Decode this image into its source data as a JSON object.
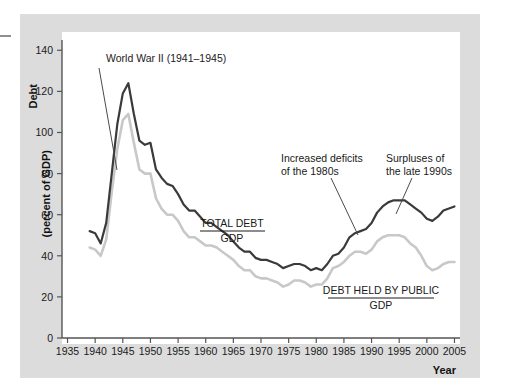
{
  "figure": {
    "background_color": "#ffffff",
    "panel_color": "#dcdcdc",
    "plot_color": "#ffffff"
  },
  "axes": {
    "y_title_line1": "Debt",
    "y_title_line2": "(percent of GDP)",
    "x_title": "Year",
    "y_ticks": [
      0,
      20,
      40,
      60,
      80,
      100,
      120,
      140
    ],
    "x_ticks": [
      1935,
      1940,
      1945,
      1950,
      1955,
      1960,
      1965,
      1970,
      1975,
      1980,
      1985,
      1990,
      1995,
      2000,
      2005
    ],
    "ylim": [
      0,
      145
    ],
    "xlim": [
      1934,
      2006
    ]
  },
  "annotations": {
    "wwii": "World War II (1941–1945)",
    "deficits_line1": "Increased deficits",
    "deficits_line2": "of the 1980s",
    "surpluses_line1": "Surpluses of",
    "surpluses_line2": "the late 1990s"
  },
  "series_labels": {
    "total_numerator": "TOTAL DEBT",
    "total_denominator": "GDP",
    "public_numerator": "DEBT HELD BY PUBLIC",
    "public_denominator": "GDP"
  },
  "colors": {
    "total_debt_line": "#3a3a3a",
    "public_debt_line": "#c8c8c8",
    "axis": "#555555",
    "leader_line": "#4a4a4a"
  },
  "chart_data": {
    "type": "line",
    "title": "",
    "xlabel": "Year",
    "ylabel": "Debt (percent of GDP)",
    "xlim": [
      1934,
      2006
    ],
    "ylim": [
      0,
      145
    ],
    "grid": false,
    "legend": "inline-labels",
    "x": [
      1939,
      1940,
      1941,
      1942,
      1943,
      1944,
      1945,
      1946,
      1947,
      1948,
      1949,
      1950,
      1951,
      1952,
      1953,
      1954,
      1955,
      1956,
      1957,
      1958,
      1959,
      1960,
      1961,
      1962,
      1963,
      1964,
      1965,
      1966,
      1967,
      1968,
      1969,
      1970,
      1971,
      1972,
      1973,
      1974,
      1975,
      1976,
      1977,
      1978,
      1979,
      1980,
      1981,
      1982,
      1983,
      1984,
      1985,
      1986,
      1987,
      1988,
      1989,
      1990,
      1991,
      1992,
      1993,
      1994,
      1995,
      1996,
      1997,
      1998,
      1999,
      2000,
      2001,
      2002,
      2003,
      2004,
      2005
    ],
    "series": [
      {
        "name": "TOTAL DEBT / GDP",
        "color": "#3a3a3a",
        "values": [
          52,
          51,
          46,
          56,
          80,
          104,
          119,
          124,
          109,
          96,
          94,
          95,
          82,
          78,
          75,
          74,
          70,
          65,
          62,
          62,
          59,
          56,
          56,
          54,
          52,
          50,
          47,
          44,
          42,
          42,
          39,
          38,
          38,
          37,
          36,
          34,
          35,
          36,
          36,
          35,
          33,
          34,
          33,
          36,
          40,
          41,
          44,
          49,
          51,
          52,
          53,
          56,
          61,
          64,
          66,
          67,
          67,
          67,
          65,
          63,
          61,
          58,
          57,
          59,
          62,
          63,
          64
        ]
      },
      {
        "name": "DEBT HELD BY PUBLIC / GDP",
        "color": "#c8c8c8",
        "values": [
          44,
          43,
          40,
          48,
          71,
          92,
          106,
          109,
          95,
          82,
          80,
          80,
          68,
          63,
          60,
          60,
          57,
          52,
          49,
          49,
          47,
          45,
          45,
          44,
          42,
          40,
          38,
          35,
          33,
          33,
          30,
          29,
          29,
          28,
          27,
          25,
          26,
          28,
          28,
          27,
          25,
          26,
          26,
          29,
          34,
          35,
          37,
          40,
          42,
          42,
          41,
          43,
          47,
          49,
          50,
          50,
          50,
          49,
          46,
          44,
          40,
          35,
          33,
          34,
          36,
          37,
          37
        ]
      }
    ]
  }
}
